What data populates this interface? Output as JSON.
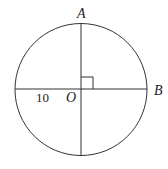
{
  "diagram": {
    "type": "circle-geometry",
    "center_label": "O",
    "point_labels": {
      "top": "A",
      "right": "B"
    },
    "segment_label": "10",
    "right_angle_marker": true,
    "stroke_color": "#333333"
  }
}
